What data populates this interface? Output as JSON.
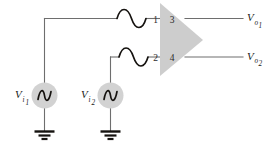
{
  "figure": {
    "background_color": "#ffffff"
  },
  "colors": {
    "amplifier_fill": "#cdcdcd",
    "source_fill": "#d2d2d2",
    "wire": "#6e6e6e",
    "glyph": "#15120f",
    "label": "#1a1a1a"
  },
  "amplifier": {
    "name": "triangle-amplifier",
    "shape": "triangle",
    "pins": [
      {
        "number": "1",
        "role": "input",
        "side": "top-left"
      },
      {
        "number": "3",
        "role": "output",
        "side": "top-right"
      },
      {
        "number": "2",
        "role": "input",
        "side": "bottom-left"
      },
      {
        "number": "4",
        "role": "output",
        "side": "bottom-right"
      }
    ]
  },
  "sources": [
    {
      "name": "source-vi1",
      "symbol": "ac-source-icon",
      "label_main": "V",
      "label_sub": "i",
      "label_sub2": "1"
    },
    {
      "name": "source-vi2",
      "symbol": "ac-source-icon",
      "label_main": "V",
      "label_sub": "i",
      "label_sub2": "2"
    }
  ],
  "outputs": [
    {
      "name": "output-vo1",
      "label_main": "V",
      "label_sub": "o",
      "label_sub2": "1",
      "from_pin": "3"
    },
    {
      "name": "output-vo2",
      "label_main": "V",
      "label_sub": "o",
      "label_sub2": "2",
      "from_pin": "4"
    }
  ],
  "signal_markers": [
    {
      "name": "sine-marker-input-1",
      "symbol": "sine-wave-icon"
    },
    {
      "name": "sine-marker-input-2",
      "symbol": "sine-wave-icon"
    }
  ],
  "grounds": [
    {
      "name": "ground-vi1",
      "symbol": "ground-icon"
    },
    {
      "name": "ground-vi2",
      "symbol": "ground-icon"
    }
  ]
}
